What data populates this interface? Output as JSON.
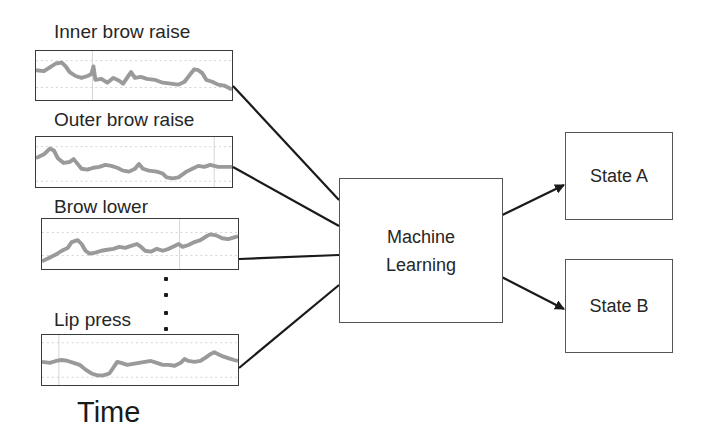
{
  "diagram": {
    "inputs": [
      {
        "label": "Inner brow raise",
        "box": {
          "x": 35,
          "y": 50,
          "w": 198,
          "h": 51
        }
      },
      {
        "label": "Outer brow raise",
        "box": {
          "x": 35,
          "y": 136,
          "w": 198,
          "h": 52
        }
      },
      {
        "label": "Brow lower",
        "box": {
          "x": 41,
          "y": 218,
          "w": 198,
          "h": 52
        }
      },
      {
        "label": "Lip press",
        "box": {
          "x": 41,
          "y": 334,
          "w": 198,
          "h": 52
        }
      }
    ],
    "ellipsis_dots": 4,
    "axis_label": "Time",
    "processor": {
      "line1": "Machine",
      "line2": "Learning"
    },
    "outputs": [
      {
        "label": "State A"
      },
      {
        "label": "State B"
      }
    ],
    "colors": {
      "signal_trace": "#9a9a9a",
      "grid": "#cfcfcf",
      "lines": "#1a1a1a",
      "box_border": "#555555"
    }
  }
}
